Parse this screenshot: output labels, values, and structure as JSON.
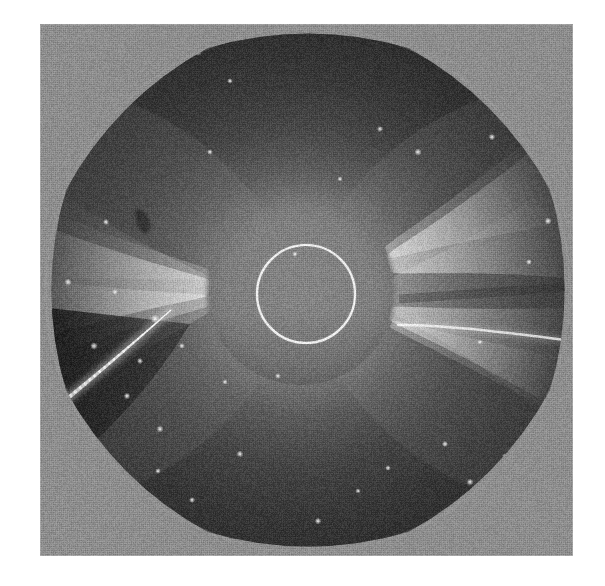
{
  "figure": {
    "kind": "solar-coronagraph-photograph",
    "canvas": {
      "width": 605,
      "height": 586,
      "background": "#ffffff"
    },
    "plate": {
      "x": 40,
      "y": 24,
      "width": 533,
      "height": 532
    }
  },
  "palette": {
    "paper": "#ffffff",
    "outside_field": "#8d8d8d",
    "sky_dark": "#3a3a3a",
    "sky_mid": "#4e4e4e",
    "corona_inner": "#9a9a9a",
    "streamer_bright": "#e8e8e8",
    "streamer_core": "#fbfbfb",
    "occulter_gray": "#7e7e7e",
    "limb_circle": "#f2f2f2",
    "deep_shadow": "#232323",
    "star_white": "#f5f5f5"
  },
  "field_of_view": {
    "shape": "rounded-octagon",
    "center_x": 268,
    "center_y": 266,
    "radius": 262,
    "corner_tone": "#8d8d8d",
    "note": "circular instrument aperture; plate corners outside aperture read light gray"
  },
  "occulter": {
    "name": "occulting-disk",
    "center_x": 261,
    "center_y": 267,
    "radius": 94,
    "fill": "#7e7e7e",
    "edge_softness_px": 7
  },
  "solar_limb": {
    "name": "solar-limb-circle",
    "center_x": 266,
    "center_y": 270,
    "radius": 49,
    "stroke": "#f2f2f2",
    "stroke_width": 2.2
  },
  "streamers": [
    {
      "name": "west-streamer-upper",
      "side": "right",
      "position_angle_deg": 17,
      "peak_brightness": "#f0f0f0",
      "extent": "to plate edge"
    },
    {
      "name": "west-streamer-lower",
      "side": "right",
      "position_angle_deg": -14,
      "peak_brightness": "#e2e2e2",
      "extent": "to plate edge"
    },
    {
      "name": "east-streamer",
      "side": "left",
      "position_angle_deg": 4,
      "peak_brightness": "#ececec",
      "extent": "to plate edge"
    }
  ],
  "features": [
    {
      "name": "comet-streak",
      "type": "bright-linear-ray",
      "x1": 131,
      "y1": 286,
      "x2": 6,
      "y2": 392,
      "core_color": "#fdfdfd",
      "halo_color": "#bfbfbf"
    },
    {
      "name": "dark-patch",
      "type": "emulsion-blemish",
      "x": 103,
      "y": 198,
      "width": 13,
      "height": 23,
      "color": "#2f2f2f"
    },
    {
      "name": "shadow-lane-lower-left",
      "type": "occulter-pylon-shadow",
      "color": "#232323"
    }
  ],
  "stars": [
    {
      "x": 158,
      "y": 28,
      "r": 1.6
    },
    {
      "x": 190,
      "y": 57,
      "r": 1.2
    },
    {
      "x": 340,
      "y": 105,
      "r": 1.3
    },
    {
      "x": 378,
      "y": 128,
      "r": 1.5
    },
    {
      "x": 452,
      "y": 113,
      "r": 1.4
    },
    {
      "x": 66,
      "y": 198,
      "r": 1.3
    },
    {
      "x": 28,
      "y": 258,
      "r": 1.5
    },
    {
      "x": 75,
      "y": 268,
      "r": 1.2
    },
    {
      "x": 115,
      "y": 295,
      "r": 1.8
    },
    {
      "x": 54,
      "y": 322,
      "r": 1.6
    },
    {
      "x": 100,
      "y": 337,
      "r": 1.3
    },
    {
      "x": 142,
      "y": 322,
      "r": 1.2
    },
    {
      "x": 87,
      "y": 372,
      "r": 1.4
    },
    {
      "x": 33,
      "y": 387,
      "r": 1.3
    },
    {
      "x": 120,
      "y": 405,
      "r": 1.5
    },
    {
      "x": 185,
      "y": 358,
      "r": 1.1
    },
    {
      "x": 238,
      "y": 352,
      "r": 1.2
    },
    {
      "x": 200,
      "y": 430,
      "r": 1.4
    },
    {
      "x": 118,
      "y": 447,
      "r": 1.2
    },
    {
      "x": 152,
      "y": 476,
      "r": 1.3
    },
    {
      "x": 41,
      "y": 462,
      "r": 1.2
    },
    {
      "x": 278,
      "y": 497,
      "r": 1.4
    },
    {
      "x": 318,
      "y": 467,
      "r": 1.1
    },
    {
      "x": 348,
      "y": 444,
      "r": 1.2
    },
    {
      "x": 405,
      "y": 420,
      "r": 1.3
    },
    {
      "x": 430,
      "y": 458,
      "r": 1.4
    },
    {
      "x": 465,
      "y": 432,
      "r": 1.2
    },
    {
      "x": 498,
      "y": 398,
      "r": 1.3
    },
    {
      "x": 440,
      "y": 318,
      "r": 1.1
    },
    {
      "x": 489,
      "y": 238,
      "r": 1.2
    },
    {
      "x": 508,
      "y": 197,
      "r": 1.5
    },
    {
      "x": 300,
      "y": 155,
      "r": 1.1
    },
    {
      "x": 255,
      "y": 230,
      "r": 1.1
    },
    {
      "x": 170,
      "y": 128,
      "r": 1.2
    }
  ]
}
